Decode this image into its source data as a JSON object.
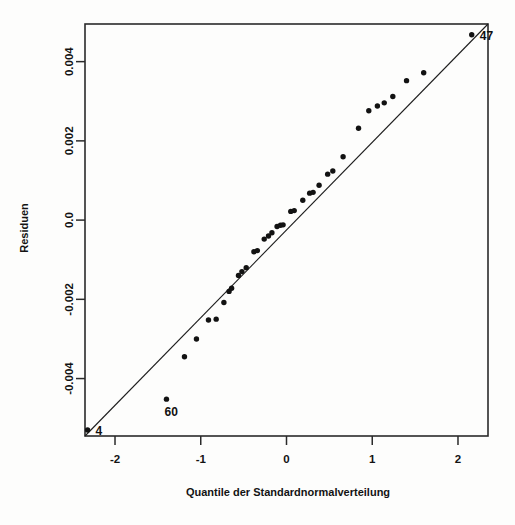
{
  "chart_data": {
    "type": "scatter",
    "title": "",
    "subtitle": "",
    "xlabel": "Quantile der Standardnormalverteilung",
    "ylabel": "Residuen",
    "xlim": [
      -2.35,
      2.35
    ],
    "ylim": [
      -0.00545,
      0.00495
    ],
    "grid": false,
    "legend": null,
    "xticks": [
      -2,
      -1,
      0,
      1,
      2
    ],
    "xticklabels": [
      "-2",
      "-1",
      "0",
      "1",
      "2"
    ],
    "yticks": [
      0.004,
      0.002,
      0.0,
      -0.002,
      -0.004
    ],
    "yticklabels": [
      "0.004",
      "0.002",
      "0.0",
      "-0.002",
      "-0.004"
    ],
    "reference_line": {
      "type": "qq-line",
      "x": [
        -2.35,
        2.35
      ],
      "y": [
        -0.00545,
        0.00495
      ]
    },
    "series": [
      {
        "name": "Residuen",
        "marker": "filled-circle",
        "color": "#121212",
        "points": [
          {
            "x": -2.32,
            "y": -0.0053,
            "label": "4"
          },
          {
            "x": -1.4,
            "y": -0.00452,
            "label": "60"
          },
          {
            "x": -1.19,
            "y": -0.00345,
            "label": ""
          },
          {
            "x": -1.05,
            "y": -0.003,
            "label": ""
          },
          {
            "x": -0.91,
            "y": -0.00252,
            "label": ""
          },
          {
            "x": -0.82,
            "y": -0.0025,
            "label": ""
          },
          {
            "x": -0.73,
            "y": -0.00208,
            "label": ""
          },
          {
            "x": -0.67,
            "y": -0.0018,
            "label": ""
          },
          {
            "x": -0.64,
            "y": -0.00172,
            "label": ""
          },
          {
            "x": -0.56,
            "y": -0.0014,
            "label": ""
          },
          {
            "x": -0.52,
            "y": -0.0013,
            "label": ""
          },
          {
            "x": -0.47,
            "y": -0.0012,
            "label": ""
          },
          {
            "x": -0.38,
            "y": -0.0008,
            "label": ""
          },
          {
            "x": -0.34,
            "y": -0.00077,
            "label": ""
          },
          {
            "x": -0.26,
            "y": -0.00048,
            "label": ""
          },
          {
            "x": -0.21,
            "y": -0.0004,
            "label": ""
          },
          {
            "x": -0.17,
            "y": -0.00032,
            "label": ""
          },
          {
            "x": -0.11,
            "y": -0.00016,
            "label": ""
          },
          {
            "x": -0.07,
            "y": -0.00013,
            "label": ""
          },
          {
            "x": -0.04,
            "y": -0.00012,
            "label": ""
          },
          {
            "x": 0.05,
            "y": 0.00022,
            "label": ""
          },
          {
            "x": 0.09,
            "y": 0.00024,
            "label": ""
          },
          {
            "x": 0.19,
            "y": 0.0005,
            "label": ""
          },
          {
            "x": 0.27,
            "y": 0.00068,
            "label": ""
          },
          {
            "x": 0.31,
            "y": 0.0007,
            "label": ""
          },
          {
            "x": 0.38,
            "y": 0.00088,
            "label": ""
          },
          {
            "x": 0.48,
            "y": 0.00116,
            "label": ""
          },
          {
            "x": 0.54,
            "y": 0.00124,
            "label": ""
          },
          {
            "x": 0.66,
            "y": 0.0016,
            "label": ""
          },
          {
            "x": 0.84,
            "y": 0.00232,
            "label": ""
          },
          {
            "x": 0.96,
            "y": 0.00276,
            "label": ""
          },
          {
            "x": 1.06,
            "y": 0.00288,
            "label": ""
          },
          {
            "x": 1.14,
            "y": 0.00296,
            "label": ""
          },
          {
            "x": 1.24,
            "y": 0.00312,
            "label": ""
          },
          {
            "x": 1.4,
            "y": 0.00352,
            "label": ""
          },
          {
            "x": 1.6,
            "y": 0.00372,
            "label": ""
          },
          {
            "x": 2.16,
            "y": 0.00468,
            "label": "47"
          }
        ]
      }
    ],
    "annotations": [
      {
        "text": "47",
        "x": 2.16,
        "y": 0.00468,
        "position": "right"
      },
      {
        "text": "60",
        "x": -1.4,
        "y": -0.00452,
        "position": "left-below"
      },
      {
        "text": "4",
        "x": -2.32,
        "y": -0.0053,
        "position": "right"
      }
    ]
  },
  "colors": {
    "background": "#fdfdfc",
    "axis": "#2a2a2a",
    "point": "#121212",
    "line": "#1d1d1d",
    "text": "#131313"
  }
}
